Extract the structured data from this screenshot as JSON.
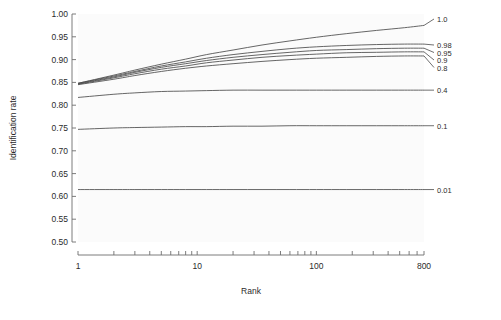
{
  "chart_data": {
    "type": "line",
    "title": "",
    "xlabel": "Rank",
    "ylabel": "Identification rate",
    "xscale": "log",
    "xlim": [
      1,
      800
    ],
    "ylim": [
      0.5,
      1.0
    ],
    "grid": false,
    "legend_position": "right-of-plot-inline-labels",
    "x_tick_labels": [
      "1",
      "10",
      "100",
      "800"
    ],
    "x_tick_values": [
      1,
      10,
      100,
      800
    ],
    "y_tick_labels": [
      "0.50",
      "0.55",
      "0.60",
      "0.65",
      "0.70",
      "0.75",
      "0.80",
      "0.85",
      "0.90",
      "0.95",
      "1.00"
    ],
    "y_tick_values": [
      0.5,
      0.55,
      0.6,
      0.65,
      0.7,
      0.75,
      0.8,
      0.85,
      0.9,
      0.95,
      1.0
    ],
    "x": [
      1,
      2,
      3,
      5,
      8,
      12,
      20,
      35,
      60,
      100,
      180,
      320,
      550,
      800
    ],
    "series": [
      {
        "name": "1.0",
        "label": "1.0",
        "values": [
          0.848,
          0.866,
          0.877,
          0.89,
          0.901,
          0.911,
          0.921,
          0.932,
          0.941,
          0.949,
          0.957,
          0.964,
          0.97,
          0.975
        ]
      },
      {
        "name": "0.98",
        "label": "0.98",
        "values": [
          0.848,
          0.864,
          0.874,
          0.886,
          0.895,
          0.903,
          0.911,
          0.918,
          0.924,
          0.928,
          0.931,
          0.933,
          0.934,
          0.934
        ]
      },
      {
        "name": "0.95",
        "label": "0.95",
        "values": [
          0.847,
          0.862,
          0.872,
          0.883,
          0.891,
          0.898,
          0.905,
          0.911,
          0.916,
          0.92,
          0.922,
          0.924,
          0.925,
          0.925
        ]
      },
      {
        "name": "0.9",
        "label": "0.9",
        "values": [
          0.846,
          0.86,
          0.869,
          0.879,
          0.886,
          0.893,
          0.899,
          0.905,
          0.909,
          0.912,
          0.915,
          0.916,
          0.917,
          0.917
        ]
      },
      {
        "name": "0.8",
        "label": "0.8",
        "values": [
          0.845,
          0.857,
          0.865,
          0.874,
          0.881,
          0.886,
          0.891,
          0.896,
          0.9,
          0.903,
          0.905,
          0.907,
          0.908,
          0.908
        ]
      },
      {
        "name": "0.4",
        "label": "0.4",
        "values": [
          0.817,
          0.824,
          0.827,
          0.83,
          0.831,
          0.832,
          0.833,
          0.833,
          0.833,
          0.833,
          0.833,
          0.833,
          0.833,
          0.833
        ]
      },
      {
        "name": "0.1",
        "label": "0.1",
        "values": [
          0.747,
          0.75,
          0.751,
          0.752,
          0.753,
          0.753,
          0.754,
          0.754,
          0.755,
          0.755,
          0.755,
          0.755,
          0.755,
          0.755
        ]
      },
      {
        "name": "0.01",
        "label": "0.01",
        "values": [
          0.615,
          0.615,
          0.615,
          0.615,
          0.615,
          0.615,
          0.615,
          0.615,
          0.615,
          0.615,
          0.615,
          0.615,
          0.615,
          0.615
        ]
      }
    ],
    "colors": {
      "curve": "#4a4a4a",
      "axis": "#6e6e6e",
      "text": "#2b2b2b",
      "panel": "#fbfbfb",
      "background": "#ffffff"
    }
  }
}
